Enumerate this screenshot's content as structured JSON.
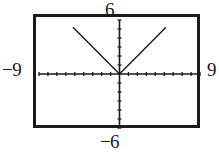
{
  "window": {
    "title": "Graphing calculator viewing window",
    "frame_color": "#1a1a1a",
    "background_color": "#ffffff"
  },
  "labels": {
    "ymax": "6",
    "ymin": "−6",
    "xmin": "−9",
    "xmax": "9"
  },
  "chart_data": {
    "type": "line",
    "title": "",
    "xlabel": "",
    "ylabel": "",
    "xlim": [
      -9,
      9
    ],
    "ylim": [
      -6,
      6
    ],
    "grid": false,
    "legend": null,
    "axis_style": {
      "x_axis_visible": true,
      "y_axis_visible": true,
      "x_tick_spacing": 1,
      "y_tick_spacing": 1,
      "x_tick_count": 17,
      "y_tick_count": 11,
      "tick_length_px": 4,
      "axis_color": "#1a1a1a"
    },
    "series": [
      {
        "name": "y = |x|",
        "color": "#1a1a1a",
        "x": [
          -5.2,
          0,
          5.2
        ],
        "y": [
          5.2,
          0,
          5.2
        ]
      }
    ],
    "annotations": [
      {
        "text": "6",
        "position": "top",
        "value": 6
      },
      {
        "text": "−6",
        "position": "bottom",
        "value": -6
      },
      {
        "text": "−9",
        "position": "left",
        "value": -9
      },
      {
        "text": "9",
        "position": "right",
        "value": 9
      }
    ]
  }
}
